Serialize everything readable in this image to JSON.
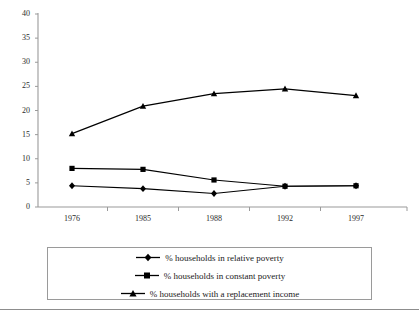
{
  "chart_data": {
    "type": "line",
    "title": "",
    "subtitle": "",
    "xlabel": "",
    "ylabel": "",
    "categories": [
      "1976",
      "1985",
      "1988",
      "1992",
      "1997"
    ],
    "ylim": [
      0,
      40
    ],
    "yticks": [
      0,
      5,
      10,
      15,
      20,
      25,
      30,
      35,
      40
    ],
    "grid": false,
    "legend_position": "bottom",
    "series": [
      {
        "name": "% households in relative poverty",
        "marker": "diamond",
        "color": "#000000",
        "values": [
          4.4,
          3.8,
          2.8,
          4.3,
          4.4
        ]
      },
      {
        "name": "% households in constant poverty",
        "marker": "square",
        "color": "#000000",
        "values": [
          8.0,
          7.8,
          5.6,
          4.3,
          4.4
        ]
      },
      {
        "name": "% households with a replacement income",
        "marker": "triangle",
        "color": "#000000",
        "values": [
          15.2,
          20.9,
          23.5,
          24.5,
          23.1
        ]
      }
    ]
  },
  "axis": {
    "y_tick_labels": [
      "40",
      "35",
      "30",
      "25",
      "20",
      "15",
      "10",
      "5",
      "0"
    ],
    "x_tick_labels": [
      "1976",
      "1985",
      "1988",
      "1992",
      "1997"
    ]
  },
  "legend": {
    "entries": [
      {
        "label": "% households in relative poverty",
        "marker": "diamond"
      },
      {
        "label": "% households in constant poverty",
        "marker": "square"
      },
      {
        "label": "% households with a replacement income",
        "marker": "triangle"
      }
    ]
  }
}
